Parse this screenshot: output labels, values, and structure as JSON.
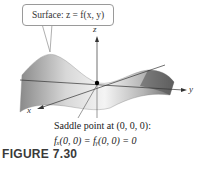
{
  "callout": {
    "text": "Surface: z = f(x, y)"
  },
  "axes": {
    "x": "x",
    "y": "y",
    "z": "z"
  },
  "caption": {
    "line1": "Saddle point at (0, 0, 0):",
    "line2": "fₓ(0, 0) = fᵧ(0, 0) = 0"
  },
  "figure": {
    "number": "FIGURE 7.30"
  }
}
